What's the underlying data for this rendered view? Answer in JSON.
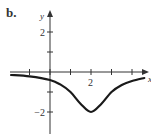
{
  "panel_label": "b.",
  "chart_data": {
    "type": "line",
    "title": "",
    "xlabel": "x",
    "ylabel": "y",
    "xlim": [
      -2,
      4.6
    ],
    "ylim": [
      -3,
      3
    ],
    "x_ticks": [
      -1,
      0,
      1,
      2,
      3,
      4
    ],
    "y_ticks": [
      -2,
      -1,
      1,
      2
    ],
    "x_tick_labels": [
      {
        "value": 2,
        "label": "2"
      }
    ],
    "y_tick_labels": [
      {
        "value": 2,
        "label": "2"
      },
      {
        "value": -2,
        "label": "−2"
      }
    ],
    "grid": false,
    "series": [
      {
        "name": "f(x)",
        "x": [
          -1.9,
          -1.0,
          0.0,
          0.5,
          1.0,
          1.5,
          2.0,
          2.5,
          3.0,
          3.5,
          4.0,
          4.6
        ],
        "y": [
          -0.15,
          -0.22,
          -0.4,
          -0.62,
          -1.0,
          -1.6,
          -2.0,
          -1.6,
          -1.0,
          -0.65,
          -0.45,
          -0.3
        ],
        "color": "#1a1a1a"
      }
    ],
    "annotations": [
      {
        "text": "minimum near (2, -2)"
      }
    ]
  },
  "colors": {
    "axis": "#333333",
    "curve": "#1a1a1a",
    "background": "#ffffff"
  }
}
